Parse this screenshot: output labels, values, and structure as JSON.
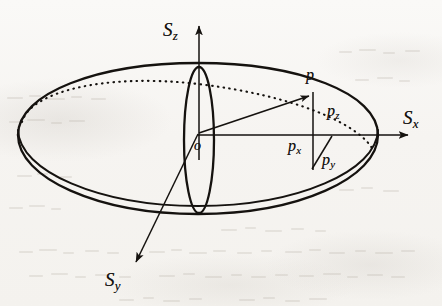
{
  "figure": {
    "kind": "diagram",
    "background_color": "#f7f5f2",
    "ink_color": "#15120f",
    "labels": {
      "axis_z": {
        "base": "S",
        "sub": "z"
      },
      "axis_x": {
        "base": "S",
        "sub": "x"
      },
      "axis_y": {
        "base": "S",
        "sub": "y"
      },
      "origin": "o",
      "point": "p",
      "component_z": {
        "base": "p",
        "sub": "z"
      },
      "component_x": {
        "base": "p",
        "sub": "x"
      },
      "component_y": {
        "base": "p",
        "sub": "y"
      }
    },
    "geometry": {
      "center": {
        "x": 198,
        "y": 135
      },
      "equator_rx": 180,
      "equator_ry": 72,
      "meridian_rx": 15,
      "meridian_ry": 73,
      "point_p": {
        "x": 313,
        "y": 94
      },
      "axis_z_tip": {
        "x": 199,
        "y": 22
      },
      "axis_x_tip": {
        "x": 412,
        "y": 135
      },
      "axis_y_tip": {
        "x": 131,
        "y": 267
      }
    }
  }
}
